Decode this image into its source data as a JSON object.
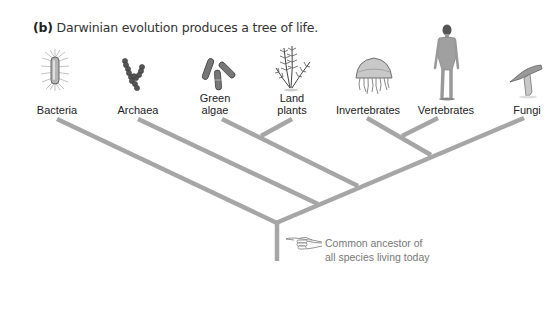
{
  "caption": {
    "panel_letter": "(b)",
    "text": "Darwinian evolution produces a tree of life."
  },
  "taxa": [
    {
      "name": "Bacteria",
      "icon": "bacterium-icon"
    },
    {
      "name": "Archaea",
      "icon": "archaea-chain-icon"
    },
    {
      "name": "Green algae",
      "line1": "Green",
      "line2": "algae",
      "icon": "green-algae-icon"
    },
    {
      "name": "Land plants",
      "line1": "Land",
      "line2": "plants",
      "icon": "fern-icon"
    },
    {
      "name": "Invertebrates",
      "icon": "jellyfish-icon"
    },
    {
      "name": "Vertebrates",
      "icon": "human-figure-icon"
    },
    {
      "name": "Fungi",
      "icon": "mushroom-icon"
    }
  ],
  "annotation": {
    "line1": "Common ancestor of",
    "line2": "all species living today",
    "icon": "pointing-hand-icon"
  },
  "colors": {
    "branch": "#a6a6a6",
    "label_text": "#222222",
    "annotation_text": "#777777"
  }
}
